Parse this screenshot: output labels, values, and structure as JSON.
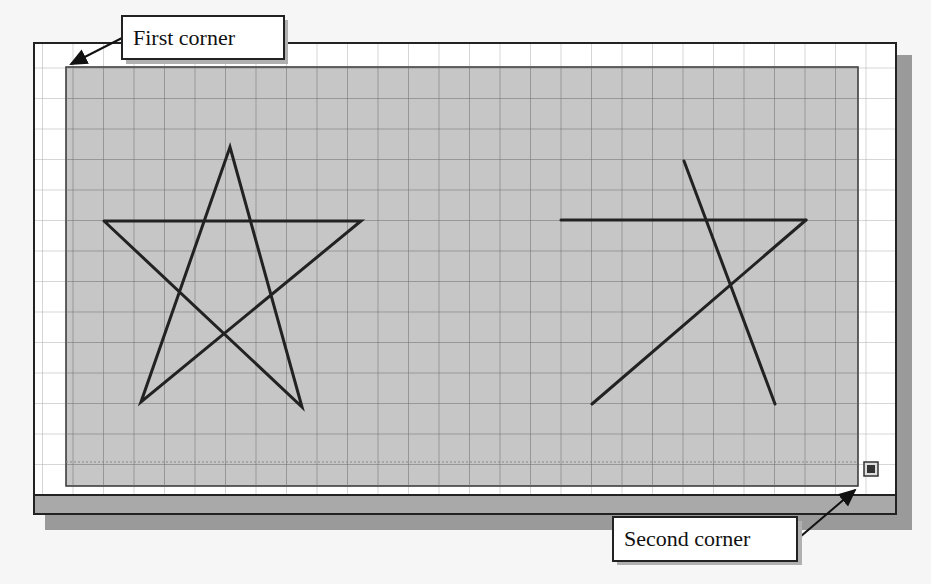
{
  "callouts": {
    "first_corner": "First corner",
    "second_corner": "Second corner"
  },
  "canvas": {
    "grid_spacing_px": 30.5,
    "selection_fill": "#c7c7c7",
    "grid_color": "#555555",
    "line_color": "#222222"
  },
  "shapes": {
    "left_star": {
      "type": "pentagram",
      "points": [
        [
          230,
          147
        ],
        [
          104,
          221
        ],
        [
          361,
          221
        ],
        [
          141,
          402
        ],
        [
          302,
          407
        ]
      ]
    },
    "right_star": {
      "type": "partial-pentagram",
      "segments": [
        [
          [
            561,
            220
          ],
          [
            806,
            220
          ]
        ],
        [
          [
            806,
            220
          ],
          [
            592,
            404
          ]
        ],
        [
          [
            684,
            161
          ],
          [
            775,
            404
          ]
        ]
      ]
    }
  }
}
